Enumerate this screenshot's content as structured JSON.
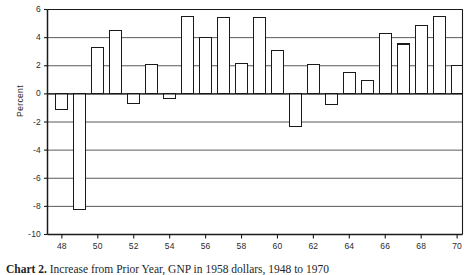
{
  "figure": {
    "caption_label": "Chart 2.",
    "caption_text": "Increase from Prior Year, GNP in 1958 dollars, 1948 to 1970"
  },
  "chart_data": {
    "type": "bar",
    "title": "",
    "subtitle": "",
    "xlabel": "",
    "ylabel": "Percent",
    "xlim": [
      47.2,
      70.3
    ],
    "ylim": [
      -10,
      6
    ],
    "ytick_step": 2,
    "grid": true,
    "grid_axis": "y",
    "legend": false,
    "bar_style": {
      "fill": "#ffffff",
      "edge": "#1a1a1a",
      "edge_width": 1.1
    },
    "x_tick_labels": [
      "48",
      "50",
      "52",
      "54",
      "56",
      "58",
      "60",
      "62",
      "64",
      "66",
      "68",
      "70"
    ],
    "x_tick_values": [
      48,
      50,
      52,
      54,
      56,
      58,
      60,
      62,
      64,
      66,
      68,
      70
    ],
    "y_tick_labels": [
      "6",
      "4",
      "2",
      "0",
      "-2",
      "-4",
      "-6",
      "-8",
      "-10"
    ],
    "y_tick_values": [
      6,
      4,
      2,
      0,
      -2,
      -4,
      -6,
      -8,
      -10
    ],
    "categories": [
      48,
      49,
      50,
      51,
      52,
      53,
      54,
      55,
      56,
      57,
      58,
      59,
      60,
      61,
      62,
      63,
      64,
      65,
      66,
      67,
      68,
      69,
      70
    ],
    "values": [
      -1.1,
      -8.2,
      3.3,
      4.5,
      -0.7,
      2.1,
      -0.35,
      5.5,
      4.0,
      5.4,
      2.15,
      5.4,
      3.1,
      -2.35,
      2.1,
      -0.75,
      1.55,
      0.95,
      4.3,
      3.55,
      4.85,
      5.5,
      2.0
    ],
    "series": [
      {
        "name": "Percent change from prior year",
        "values": [
          -1.1,
          -8.2,
          3.3,
          4.5,
          -0.7,
          2.1,
          -0.35,
          5.5,
          4.0,
          5.4,
          2.15,
          5.4,
          3.1,
          -2.35,
          2.1,
          -0.75,
          1.55,
          0.95,
          4.3,
          3.55,
          4.85,
          5.5,
          2.0
        ]
      }
    ]
  }
}
